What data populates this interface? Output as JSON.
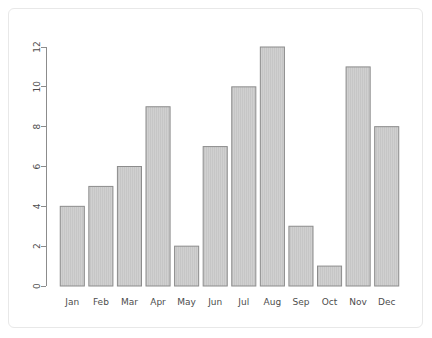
{
  "chart_data": {
    "type": "bar",
    "title": "",
    "subtitle": "",
    "xlabel": "",
    "ylabel": "",
    "categories": [
      "Jan",
      "Feb",
      "Mar",
      "Apr",
      "May",
      "Jun",
      "Jul",
      "Aug",
      "Sep",
      "Oct",
      "Nov",
      "Dec"
    ],
    "values": [
      4,
      5,
      6,
      9,
      2,
      7,
      10,
      12,
      3,
      1,
      11,
      8
    ],
    "ylim": [
      0,
      12
    ],
    "yticks": [
      0,
      2,
      4,
      6,
      8,
      10,
      12
    ],
    "ytick_labels": [
      "0",
      "2",
      "4",
      "6",
      "8",
      "10",
      "12"
    ],
    "grid": false,
    "legend": null,
    "legend_position": "none",
    "annotations": [],
    "bar_fill_color": "#d0d0d0",
    "bar_border_color": "#8c8c8c",
    "axis_color": "#8c8c8c",
    "tick_label_color": "#4d4d4d",
    "background_color": "#ffffff",
    "frame_border_color": "#e8e8e8",
    "y_axis_label_rotation": "90"
  }
}
